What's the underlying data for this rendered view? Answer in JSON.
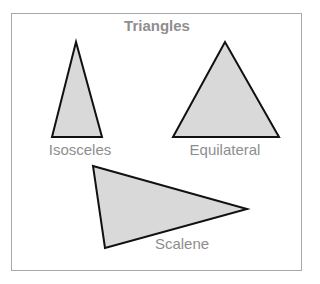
{
  "title": "Triangles",
  "colors": {
    "frame": "#a8a8a8",
    "text": "#8e8e8e",
    "fill": "#d9d9d9",
    "stroke": "#111111"
  },
  "triangles": [
    {
      "name": "isosceles",
      "label": "Isosceles",
      "points": "76,42 52,137 102,137",
      "label_x": 80,
      "label_y": 141
    },
    {
      "name": "equilateral",
      "label": "Equilateral",
      "points": "225,42 173,137 279,137",
      "label_x": 225,
      "label_y": 141
    },
    {
      "name": "scalene",
      "label": "Scalene",
      "points": "93,166 247,209 105,248",
      "label_x": 182,
      "label_y": 235
    }
  ]
}
